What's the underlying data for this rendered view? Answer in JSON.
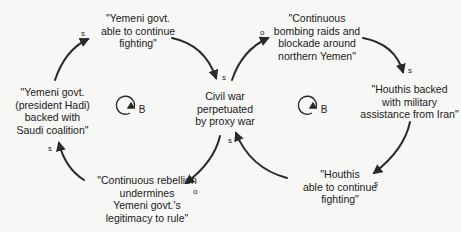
{
  "diagram": {
    "type": "causal-loop-diagram",
    "center_node": {
      "id": "civil_war",
      "label": "Civil war\nperpetuated\nby proxy war"
    },
    "nodes": [
      {
        "id": "yemeni_able",
        "label": "\"Yemeni govt.\nable to continue\nfighting\""
      },
      {
        "id": "bombing",
        "label": "\"Continuous\nbombing raids and\nblockade around\nnorthern Yemen\""
      },
      {
        "id": "houthis_iran",
        "label": "\"Houthis backed\nwith military\nassistance from Iran\""
      },
      {
        "id": "houthis_able",
        "label": "\"Houthis\nable to continue\nfighting\""
      },
      {
        "id": "rebellion",
        "label": "\"Continuous rebellion\nundermines\nYemeni govt.'s\nlegitimacy to rule\""
      },
      {
        "id": "yemeni_saudi",
        "label": "\"Yemeni govt.\n(president Hadi)\nbacked with\nSaudi coalition\""
      }
    ],
    "links": [
      {
        "from": "yemeni_saudi",
        "to": "yemeni_able",
        "polarity": "s"
      },
      {
        "from": "yemeni_able",
        "to": "civil_war",
        "polarity": "s"
      },
      {
        "from": "civil_war",
        "to": "bombing",
        "polarity": "o"
      },
      {
        "from": "bombing",
        "to": "houthis_iran",
        "polarity": "s"
      },
      {
        "from": "houthis_iran",
        "to": "houthis_able",
        "polarity": "s"
      },
      {
        "from": "houthis_able",
        "to": "civil_war",
        "polarity": "s"
      },
      {
        "from": "civil_war",
        "to": "rebellion",
        "polarity": "o"
      },
      {
        "from": "rebellion",
        "to": "yemeni_saudi",
        "polarity": "s"
      }
    ],
    "loops": [
      {
        "id": "left_loop",
        "label": "B",
        "type": "balancing"
      },
      {
        "id": "right_loop",
        "label": "B",
        "type": "balancing"
      }
    ]
  },
  "colors": {
    "background": "#f7f7f5",
    "ink": "#1a1a1a",
    "arrow": "#2a2a2a"
  }
}
